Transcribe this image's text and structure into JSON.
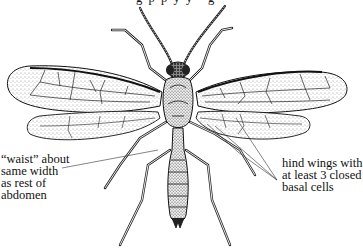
{
  "figure": {
    "top_caption_fragment": "g  p  p  y  y     g",
    "annotations": [
      {
        "id": "waist",
        "text": "“waist” about\nsame width\nas rest of\nabdomen"
      },
      {
        "id": "hind-wings",
        "text": "hind wings with\nat least 3 closed\nbasal cells"
      }
    ]
  }
}
